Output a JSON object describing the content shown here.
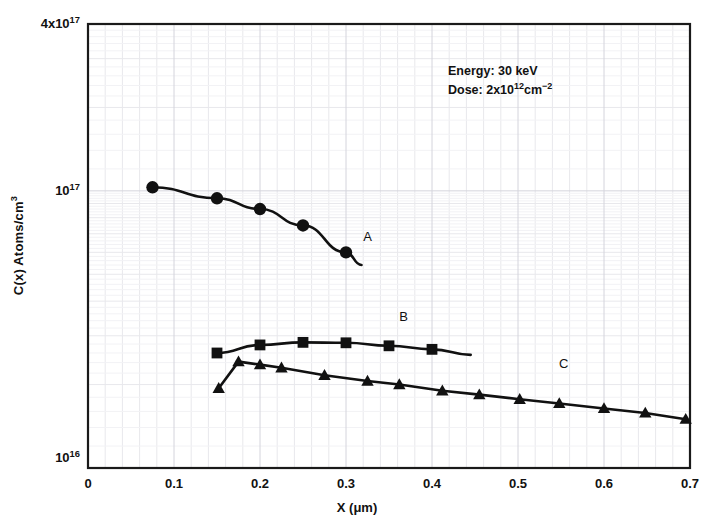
{
  "chart_data": {
    "type": "line",
    "title": "",
    "subtitle": "",
    "xlabel": "X (μm)",
    "ylabel": "C(x) Atoms/cm³",
    "yscale": "log",
    "xlim": [
      0,
      0.7
    ],
    "ylim": [
      1e+16,
      4e+17
    ],
    "grid": true,
    "legend_position": "inline-curve-labels",
    "xticks": [
      "0",
      "0.1",
      "0.2",
      "0.3",
      "0.4",
      "0.5",
      "0.6",
      "0.7"
    ],
    "xtick_values": [
      0,
      0.1,
      0.2,
      0.3,
      0.4,
      0.5,
      0.6,
      0.7
    ],
    "yticks": [
      "4x10",
      "10",
      "10"
    ],
    "ytick_labels": [
      {
        "mantissa": "4x10",
        "exponent": "17",
        "value": 4e+17
      },
      {
        "mantissa": "10",
        "exponent": "17",
        "value": 1e+17
      },
      {
        "mantissa": "10",
        "exponent": "16",
        "value": 1e+16
      }
    ],
    "annotations": [
      {
        "name": "energy",
        "text": "Energy: 30 keV"
      },
      {
        "name": "dose",
        "text_prefix": "Dose: 2x10",
        "exp1": "12",
        "text_mid": "cm",
        "exp2": "−2"
      }
    ],
    "series": [
      {
        "name": "A",
        "label": "A",
        "marker": "circle",
        "label_x": 0.325,
        "label_y": 6.6e+16,
        "points": [
          {
            "x": 0.075,
            "y": 1.03e+17
          },
          {
            "x": 0.15,
            "y": 9.4e+16
          },
          {
            "x": 0.2,
            "y": 8.6e+16
          },
          {
            "x": 0.25,
            "y": 7.5e+16
          },
          {
            "x": 0.3,
            "y": 6e+16
          }
        ],
        "line_end": {
          "x": 0.318,
          "y": 5.4e+16
        }
      },
      {
        "name": "B",
        "label": "B",
        "marker": "square",
        "label_x": 0.367,
        "label_y": 3.4e+16,
        "points": [
          {
            "x": 0.15,
            "y": 2.6e+16
          },
          {
            "x": 0.2,
            "y": 2.78e+16
          },
          {
            "x": 0.25,
            "y": 2.84e+16
          },
          {
            "x": 0.3,
            "y": 2.83e+16
          },
          {
            "x": 0.35,
            "y": 2.76e+16
          },
          {
            "x": 0.4,
            "y": 2.68e+16
          }
        ],
        "line_end": {
          "x": 0.445,
          "y": 2.56e+16
        }
      },
      {
        "name": "C",
        "label": "C",
        "marker": "triangle",
        "label_x": 0.553,
        "label_y": 2.3e+16,
        "points": [
          {
            "x": 0.152,
            "y": 1.94e+16
          },
          {
            "x": 0.175,
            "y": 2.42e+16
          },
          {
            "x": 0.2,
            "y": 2.36e+16
          },
          {
            "x": 0.225,
            "y": 2.3e+16
          },
          {
            "x": 0.275,
            "y": 2.16e+16
          },
          {
            "x": 0.325,
            "y": 2.06e+16
          },
          {
            "x": 0.362,
            "y": 2e+16
          },
          {
            "x": 0.412,
            "y": 1.9e+16
          },
          {
            "x": 0.455,
            "y": 1.84e+16
          },
          {
            "x": 0.502,
            "y": 1.77e+16
          },
          {
            "x": 0.548,
            "y": 1.71e+16
          },
          {
            "x": 0.6,
            "y": 1.64e+16
          },
          {
            "x": 0.648,
            "y": 1.58e+16
          },
          {
            "x": 0.695,
            "y": 1.5e+16
          }
        ]
      }
    ]
  },
  "colors": {
    "ink": "#111111",
    "grid_minor": "#e8e8ec",
    "grid_major": "#d4d4dc",
    "axis": "#1a1a1a",
    "background": "#ffffff"
  }
}
